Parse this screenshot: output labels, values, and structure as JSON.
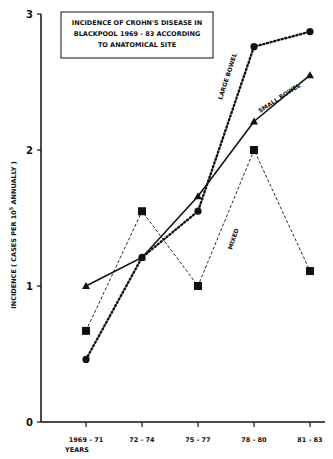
{
  "chart_data": {
    "type": "line",
    "title_lines": [
      "INCIDENCE OF CROHN'S DISEASE IN",
      "BLACKPOOL 1969 - 83 ACCORDING",
      "TO ANATOMICAL SITE"
    ],
    "xlabel": "YEARS",
    "ylabel": "INCIDENCE ( CASES PER 10^5 ANNUALLY )",
    "categories": [
      "1969 - 71",
      "72 - 74",
      "75 - 77",
      "78 - 80",
      "81 - 83"
    ],
    "yticks": [
      "0",
      "1",
      "2",
      "3"
    ],
    "ylim": [
      0,
      3
    ],
    "grid": false,
    "series": [
      {
        "name": "LARGE BOWEL",
        "marker": "circle",
        "style": "dotted",
        "values": [
          0.46,
          1.21,
          1.55,
          2.76,
          2.87
        ]
      },
      {
        "name": "SMALL BOWEL",
        "marker": "triangle",
        "style": "solid",
        "values": [
          1.0,
          1.21,
          1.66,
          2.21,
          2.55
        ]
      },
      {
        "name": "MIXED",
        "marker": "square",
        "style": "dashed",
        "values": [
          0.67,
          1.55,
          1.0,
          2.0,
          1.11
        ]
      }
    ]
  }
}
